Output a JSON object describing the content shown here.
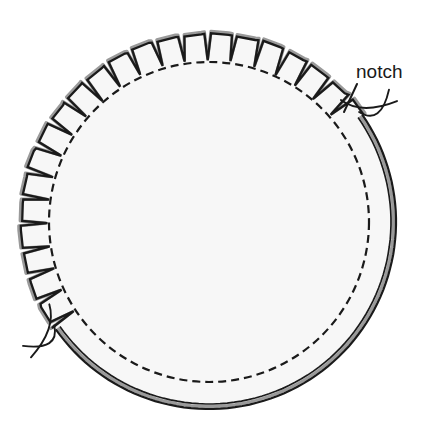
{
  "figure": {
    "background_color": "#ffffff",
    "disc_fill_color": "#f7f7f7",
    "ink_color": "#1a1a1a",
    "shading_color": "#9a9a9a"
  },
  "annotations": [
    {
      "id": "notch-label",
      "text": "notch",
      "x": 356,
      "y": 78,
      "leader_from_x": 357,
      "leader_from_y": 84,
      "leader_to_x": 344,
      "leader_to_y": 112
    }
  ],
  "geometry": {
    "center_x": 209,
    "center_y": 222,
    "outer_radius": 188,
    "dashed_radius": 160,
    "notch_depth": 26,
    "notch_count": 22,
    "notched_arc_start_deg": 35,
    "notched_arc_end_deg": 215,
    "dash_pattern": "8 5",
    "smooth_arc_start_deg": 35,
    "smooth_arc_end_deg": -145
  },
  "features": [
    {
      "name": "outer-notched-edge",
      "label": "Notched outer edge"
    },
    {
      "name": "inner-dashed-circle",
      "label": "Hidden inner circle (dashed)"
    },
    {
      "name": "smooth-lower-arc",
      "label": "Smooth lower rim (double line)"
    },
    {
      "name": "break-tail-left",
      "label": "Break line left"
    },
    {
      "name": "break-tail-right",
      "label": "Break line right"
    }
  ]
}
